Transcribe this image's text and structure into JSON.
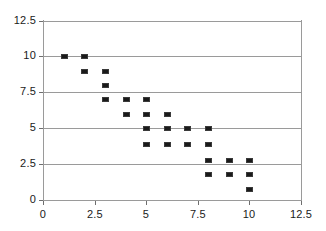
{
  "chart_data": {
    "type": "scatter",
    "title": "",
    "subtitle": "",
    "xlabel": "",
    "ylabel": "",
    "xlim": [
      0,
      12.5
    ],
    "ylim": [
      0,
      12.5
    ],
    "xticks": [
      0,
      2.5,
      5,
      7.5,
      10,
      12.5
    ],
    "yticks": [
      0,
      2.5,
      5,
      7.5,
      10,
      12.5
    ],
    "xtick_labels": [
      "0",
      "2.5",
      "5",
      "7.5",
      "10",
      "12.5"
    ],
    "ytick_labels": [
      "0",
      "2.5",
      "5",
      "7.5",
      "10",
      "12.5"
    ],
    "grid": "horizontal",
    "legend": null,
    "marker": {
      "shape": "square",
      "color": "#1a1a1a",
      "size": 5
    },
    "series": [
      {
        "name": "Series1",
        "points": [
          {
            "x": 1,
            "y": 10
          },
          {
            "x": 2,
            "y": 10
          },
          {
            "x": 2,
            "y": 9
          },
          {
            "x": 3,
            "y": 9
          },
          {
            "x": 3,
            "y": 8
          },
          {
            "x": 3,
            "y": 7
          },
          {
            "x": 4,
            "y": 7
          },
          {
            "x": 5,
            "y": 7
          },
          {
            "x": 4,
            "y": 6
          },
          {
            "x": 5,
            "y": 6
          },
          {
            "x": 6,
            "y": 6
          },
          {
            "x": 5,
            "y": 5
          },
          {
            "x": 6,
            "y": 5
          },
          {
            "x": 7,
            "y": 5
          },
          {
            "x": 8,
            "y": 5
          },
          {
            "x": 5,
            "y": 3.9
          },
          {
            "x": 6,
            "y": 3.9
          },
          {
            "x": 7,
            "y": 3.9
          },
          {
            "x": 8,
            "y": 3.9
          },
          {
            "x": 8,
            "y": 2.8
          },
          {
            "x": 9,
            "y": 2.8
          },
          {
            "x": 10,
            "y": 2.8
          },
          {
            "x": 8,
            "y": 1.8
          },
          {
            "x": 9,
            "y": 1.8
          },
          {
            "x": 10,
            "y": 1.8
          },
          {
            "x": 10,
            "y": 0.8
          }
        ]
      }
    ],
    "colors": {
      "marker": "#1a1a1a",
      "grid": "#9a9a9a",
      "axis": "#9a9a9a",
      "text": "#1a1a1a",
      "background": "#ffffff"
    }
  }
}
